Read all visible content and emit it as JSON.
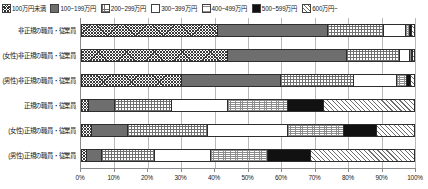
{
  "chart_data": {
    "type": "bar",
    "orientation": "horizontal",
    "stacked": true,
    "normalized": true,
    "title": "",
    "xlabel": "",
    "ylabel": "",
    "xlim": [
      0,
      100
    ],
    "grid": true,
    "legend_position": "top",
    "x_tick_labels": [
      "0%",
      "10%",
      "20%",
      "30%",
      "40%",
      "50%",
      "60%",
      "70%",
      "80%",
      "90%",
      "100%"
    ],
    "x_tick_values": [
      0,
      10,
      20,
      30,
      40,
      50,
      60,
      70,
      80,
      90,
      100
    ],
    "categories": [
      "非正規の職員・従業員",
      "(女性)非正規の職員・従業員",
      "(男性)非正規の職員・従業員",
      "正規の職員・従業員",
      "(女性)正規の職員・従業員",
      "(男性)正規の職員・従業員"
    ],
    "series": [
      {
        "name": "100万円未満",
        "pattern": "crosshatch",
        "values": [
          41.0,
          44.0,
          30.0,
          2.0,
          3.0,
          1.5
        ]
      },
      {
        "name": "100~199万円",
        "pattern": "solidgray",
        "values": [
          33.0,
          36.0,
          30.0,
          8.0,
          11.0,
          4.5
        ]
      },
      {
        "name": "200~299万円",
        "pattern": "grid",
        "values": [
          17.0,
          16.0,
          22.0,
          17.0,
          24.0,
          16.0
        ]
      },
      {
        "name": "300~399万円",
        "pattern": "white",
        "values": [
          6.5,
          3.0,
          13.0,
          17.0,
          24.0,
          17.0
        ]
      },
      {
        "name": "400~499万円",
        "pattern": "dots",
        "values": [
          1.3,
          0.6,
          2.8,
          18.0,
          17.0,
          17.0
        ]
      },
      {
        "name": "500~599万円",
        "pattern": "black",
        "values": [
          0.7,
          0.2,
          1.4,
          11.0,
          10.0,
          13.0
        ]
      },
      {
        "name": "600万円~",
        "pattern": "diag",
        "values": [
          0.5,
          0.2,
          0.8,
          27.0,
          11.0,
          31.0
        ]
      }
    ]
  },
  "legend": {
    "items": [
      {
        "label": "100万円未満",
        "swatch": "crosshatch-swatch"
      },
      {
        "label": "100~199万円",
        "swatch": "solid-gray-swatch"
      },
      {
        "label": "200~299万円",
        "swatch": "grid-swatch"
      },
      {
        "label": "300~399万円",
        "swatch": "white-swatch"
      },
      {
        "label": "400~499万円",
        "swatch": "dots-swatch"
      },
      {
        "label": "500~599万円",
        "swatch": "black-swatch"
      },
      {
        "label": "600万円~",
        "swatch": "diagonal-swatch"
      }
    ]
  }
}
